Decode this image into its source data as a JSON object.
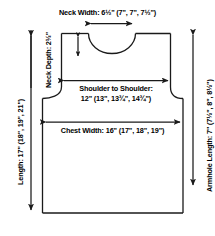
{
  "diagram": {
    "type": "garment-schematic",
    "units": "inches",
    "sizes_note": "first value is smallest size; values in parentheses are larger sizes",
    "colors": {
      "line": "#1a1a1a",
      "text": "#000000",
      "background": "#ffffff"
    }
  },
  "measurements": {
    "neck_width": {
      "label": "Neck Width:",
      "value": "6½\" (7\", 7\", 7½\")",
      "base": "6½\"",
      "alternates": [
        "7\"",
        "7\"",
        "7½\""
      ]
    },
    "neck_depth": {
      "label": "Neck Depth:",
      "value": "2½\"",
      "base": "2½\"",
      "alternates": []
    },
    "shoulder_to_shoulder": {
      "label": "Shoulder to Shoulder:",
      "value": "12\" (13\", 13¾\", 14¾\")",
      "base": "12\"",
      "alternates": [
        "13\"",
        "13¾\"",
        "14¾\""
      ]
    },
    "chest_width": {
      "label": "Chest Width:",
      "value": "16\" (17\", 18\", 19\")",
      "base": "16\"",
      "alternates": [
        "17\"",
        "18\"",
        "19\""
      ]
    },
    "length": {
      "label": "Length:",
      "value": "17\" (18\", 19\", 21\")",
      "base": "17\"",
      "alternates": [
        "18\"",
        "19\"",
        "21\""
      ]
    },
    "armhole_length": {
      "label": "Armhole Length:",
      "value": "7\" (7½\", 8\", 8½\")",
      "base": "7\"",
      "alternates": [
        "7½\"",
        "8\"",
        "8½\""
      ]
    }
  },
  "labels": {
    "neck_width_text": "Neck Width:  6½\" (7\", 7\", 7½\")",
    "neck_depth_text": "Neck Depth: 2½\"",
    "shoulder_line1": "Shoulder to Shoulder:",
    "shoulder_line2": "12\" (13\", 13¾\", 14¾\")",
    "chest_width_text": "Chest Width: 16\" (17\", 18\", 19\")",
    "length_text": "Length: 17\" (18\", 19\", 21\")",
    "armhole_text": "Armhole Length: 7\" (7½\", 8\", 8½\")"
  }
}
